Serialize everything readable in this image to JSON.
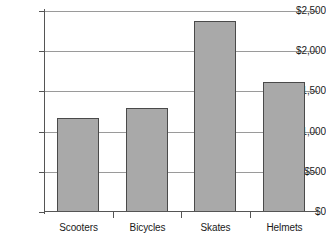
{
  "chart_data": {
    "type": "bar",
    "title": "",
    "xlabel": "",
    "ylabel": "",
    "categories": [
      "Scooters",
      "Bicycles",
      "Skates",
      "Helmets"
    ],
    "values": [
      1170,
      1295,
      2375,
      1620
    ],
    "ylim": [
      0,
      2500
    ],
    "ytick_values": [
      0,
      500,
      1000,
      1500,
      2000,
      2500
    ],
    "ytick_labels": [
      "$0",
      "$500",
      "$1,000",
      "$1,500",
      "$2,000",
      "$2,500"
    ],
    "grid": true,
    "legend": null,
    "bar_color": "#a9a9a9",
    "bar_edge_color": "#4a4a4a",
    "gridline_color": "#9a9a9a",
    "axis_color": "#555555",
    "background_color": "#ffffff"
  }
}
